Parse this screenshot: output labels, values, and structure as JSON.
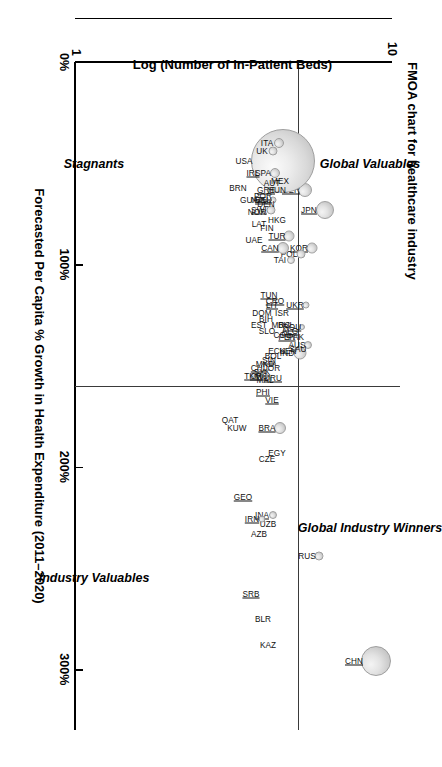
{
  "chart": {
    "title": "FMOA chart for healthcare industry",
    "x_axis_title": "Forecasted Per Capita % Growth in Health Expenditure (2011–2020)",
    "y_axis_title": "Log (Number of In-Patient Beds)",
    "x_ticks": [
      "0%",
      "100%",
      "200%",
      "300%"
    ],
    "y_ticks": [
      "10",
      "1"
    ],
    "quadrants": {
      "top_left": "Global Valuables",
      "top_right": "Global Industry Winners",
      "bottom_left": "Stagnants",
      "bottom_right": "Industry Valuables"
    }
  },
  "chart_data": {
    "type": "scatter",
    "title": "FMOA chart for healthcare industry",
    "xlabel": "Forecasted Per Capita % Growth in Health Expenditure (2011–2020)",
    "ylabel": "Log (Number of In-Patient Beds)",
    "xlim": [
      0,
      330
    ],
    "ylim": [
      1,
      10
    ],
    "xtick_values": [
      0,
      100,
      200,
      300
    ],
    "xtick_labels": [
      "0%",
      "100%",
      "200%",
      "300%"
    ],
    "ytick_values": [
      1,
      10
    ],
    "ytick_labels": [
      "1",
      "10"
    ],
    "grid": false,
    "legend": "none",
    "quadrant_divider_x": 160,
    "quadrant_divider_y": 7.35,
    "annotations": [
      {
        "text": "Global Valuables",
        "quadrant": "top-left"
      },
      {
        "text": "Global Industry Winners",
        "quadrant": "top-right"
      },
      {
        "text": "Stagnants",
        "quadrant": "bottom-left"
      },
      {
        "text": "Industry Valuables",
        "quadrant": "bottom-right"
      }
    ],
    "points": [
      {
        "label": "CHN",
        "x": 296,
        "y": 9.55,
        "size": 30,
        "underline": true
      },
      {
        "label": "IND",
        "x": 144,
        "y": 7.38,
        "size": 13,
        "underline": false
      },
      {
        "label": "RUS",
        "x": 244,
        "y": 7.92,
        "size": 9,
        "underline": false
      },
      {
        "label": "BRA",
        "x": 181,
        "y": 6.82,
        "size": 12,
        "underline": true
      },
      {
        "label": "VIE",
        "x": 167,
        "y": 6.58,
        "size": 0,
        "underline": true
      },
      {
        "label": "EGY",
        "x": 193,
        "y": 6.72,
        "size": 0,
        "underline": false
      },
      {
        "label": "CZE",
        "x": 196,
        "y": 6.45,
        "size": 0,
        "underline": false
      },
      {
        "label": "PHI",
        "x": 163,
        "y": 6.32,
        "size": 0,
        "underline": true
      },
      {
        "label": "INA",
        "x": 224,
        "y": 6.6,
        "size": 8,
        "underline": true
      },
      {
        "label": "UZB",
        "x": 228,
        "y": 6.48,
        "size": 0,
        "underline": false
      },
      {
        "label": "IRN",
        "x": 226,
        "y": 6.3,
        "size": 7,
        "underline": true
      },
      {
        "label": "AZB",
        "x": 233,
        "y": 6.22,
        "size": 0,
        "underline": false
      },
      {
        "label": "GEO",
        "x": 215,
        "y": 5.75,
        "size": 0,
        "underline": true
      },
      {
        "label": "SRB",
        "x": 263,
        "y": 5.98,
        "size": 0,
        "underline": true
      },
      {
        "label": "BLR",
        "x": 275,
        "y": 6.32,
        "size": 0,
        "underline": false
      },
      {
        "label": "KAZ",
        "x": 288,
        "y": 6.48,
        "size": 0,
        "underline": false
      },
      {
        "label": "KUW",
        "x": 181,
        "y": 5.58,
        "size": 0,
        "underline": false
      },
      {
        "label": "QAT",
        "x": 177,
        "y": 5.38,
        "size": 0,
        "underline": false
      },
      {
        "label": "SYK",
        "x": 153,
        "y": 6.3,
        "size": 0,
        "underline": true
      },
      {
        "label": "MAL",
        "x": 157,
        "y": 6.38,
        "size": 0,
        "underline": false
      },
      {
        "label": "CHI",
        "x": 151,
        "y": 6.18,
        "size": 0,
        "underline": true
      },
      {
        "label": "TKM",
        "x": 155,
        "y": 6.05,
        "size": 0,
        "underline": true
      },
      {
        "label": "JPN",
        "x": 73,
        "y": 8.08,
        "size": 18,
        "underline": true
      },
      {
        "label": "KOR",
        "x": 92,
        "y": 7.72,
        "size": 11,
        "underline": true
      },
      {
        "label": "UKR",
        "x": 120,
        "y": 7.55,
        "size": 7,
        "underline": true
      },
      {
        "label": "ROU",
        "x": 131,
        "y": 7.45,
        "size": 6,
        "underline": true
      },
      {
        "label": "AUS",
        "x": 140,
        "y": 7.62,
        "size": 8,
        "underline": false
      },
      {
        "label": "PAK",
        "x": 136,
        "y": 7.28,
        "size": 0,
        "underline": false
      },
      {
        "label": "SAU",
        "x": 142,
        "y": 7.32,
        "size": 0,
        "underline": false
      },
      {
        "label": "POL",
        "x": 95,
        "y": 7.4,
        "size": 9,
        "underline": false
      },
      {
        "label": "TUR",
        "x": 86,
        "y": 7.08,
        "size": 11,
        "underline": true
      },
      {
        "label": "TAI",
        "x": 98,
        "y": 7.12,
        "size": 8,
        "underline": false
      },
      {
        "label": "CAN",
        "x": 92,
        "y": 6.9,
        "size": 12,
        "underline": true
      },
      {
        "label": "ALG",
        "x": 133,
        "y": 7.1,
        "size": 0,
        "underline": true
      },
      {
        "label": "BUL",
        "x": 130,
        "y": 6.98,
        "size": 0,
        "underline": false
      },
      {
        "label": "PER",
        "x": 136,
        "y": 7.02,
        "size": 0,
        "underline": true
      },
      {
        "label": "KEN",
        "x": 143,
        "y": 7.05,
        "size": 0,
        "underline": false
      },
      {
        "label": "ISR",
        "x": 124,
        "y": 6.88,
        "size": 0,
        "underline": false
      },
      {
        "label": "MRC",
        "x": 130,
        "y": 6.84,
        "size": 0,
        "underline": false
      },
      {
        "label": "COL",
        "x": 135,
        "y": 6.88,
        "size": 0,
        "underline": false
      },
      {
        "label": "ECU",
        "x": 143,
        "y": 6.72,
        "size": 0,
        "underline": false
      },
      {
        "label": "BOL",
        "x": 145,
        "y": 6.6,
        "size": 0,
        "underline": false
      },
      {
        "label": "SIN",
        "x": 147,
        "y": 6.5,
        "size": 0,
        "underline": true
      },
      {
        "label": "JOR",
        "x": 151,
        "y": 6.58,
        "size": 0,
        "underline": false
      },
      {
        "label": "URU",
        "x": 156,
        "y": 6.62,
        "size": 0,
        "underline": true
      },
      {
        "label": "MKD",
        "x": 149,
        "y": 6.38,
        "size": 0,
        "underline": false
      },
      {
        "label": "CRC",
        "x": 155,
        "y": 6.22,
        "size": 0,
        "underline": true
      },
      {
        "label": "CRO",
        "x": 118,
        "y": 6.68,
        "size": 0,
        "underline": true
      },
      {
        "label": "LIT",
        "x": 120,
        "y": 6.58,
        "size": 0,
        "underline": true
      },
      {
        "label": "TUN",
        "x": 115,
        "y": 6.5,
        "size": 0,
        "underline": true
      },
      {
        "label": "BIH",
        "x": 127,
        "y": 6.4,
        "size": 0,
        "underline": false
      },
      {
        "label": "DOM",
        "x": 124,
        "y": 6.3,
        "size": 0,
        "underline": false
      },
      {
        "label": "SLO",
        "x": 133,
        "y": 6.45,
        "size": 0,
        "underline": false
      },
      {
        "label": "EST",
        "x": 130,
        "y": 6.2,
        "size": 0,
        "underline": false
      },
      {
        "label": "GER",
        "x": 63,
        "y": 7.52,
        "size": 14,
        "underline": true
      },
      {
        "label": "FRA",
        "x": 58,
        "y": 7.25,
        "size": 13,
        "underline": false
      },
      {
        "label": "USA",
        "x": 49,
        "y": 6.9,
        "size": 64,
        "underline": false
      },
      {
        "label": "ITA",
        "x": 40,
        "y": 6.78,
        "size": 10,
        "underline": false
      },
      {
        "label": "UK",
        "x": 44,
        "y": 6.62,
        "size": 9,
        "underline": false
      },
      {
        "label": "MEX",
        "x": 59,
        "y": 6.82,
        "size": 0,
        "underline": false
      },
      {
        "label": "SPA",
        "x": 55,
        "y": 6.68,
        "size": 10,
        "underline": false
      },
      {
        "label": "HUN",
        "x": 63,
        "y": 6.72,
        "size": 0,
        "underline": false
      },
      {
        "label": "AUT",
        "x": 60,
        "y": 6.58,
        "size": 0,
        "underline": false
      },
      {
        "label": "BEL",
        "x": 68,
        "y": 6.62,
        "size": 7,
        "underline": true
      },
      {
        "label": "SWI",
        "x": 73,
        "y": 6.55,
        "size": 9,
        "underline": true
      },
      {
        "label": "HKG",
        "x": 78,
        "y": 6.72,
        "size": 0,
        "underline": false
      },
      {
        "label": "FIN",
        "x": 82,
        "y": 6.45,
        "size": 0,
        "underline": false
      },
      {
        "label": "GRE",
        "x": 63,
        "y": 6.42,
        "size": 0,
        "underline": true
      },
      {
        "label": "POR",
        "x": 66,
        "y": 6.32,
        "size": 0,
        "underline": true
      },
      {
        "label": "DEN",
        "x": 70,
        "y": 6.4,
        "size": 0,
        "underline": false
      },
      {
        "label": "NZL",
        "x": 68,
        "y": 6.22,
        "size": 0,
        "underline": false
      },
      {
        "label": "NOR",
        "x": 74,
        "y": 6.15,
        "size": 0,
        "underline": false
      },
      {
        "label": "LAT",
        "x": 80,
        "y": 6.22,
        "size": 0,
        "underline": false
      },
      {
        "label": "UAE",
        "x": 88,
        "y": 6.08,
        "size": 0,
        "underline": false
      },
      {
        "label": "IRL",
        "x": 55,
        "y": 6.05,
        "size": 0,
        "underline": true
      },
      {
        "label": "GUA",
        "x": 68,
        "y": 5.92,
        "size": 0,
        "underline": false
      },
      {
        "label": "BRN",
        "x": 62,
        "y": 5.62,
        "size": 0,
        "underline": false
      }
    ]
  }
}
